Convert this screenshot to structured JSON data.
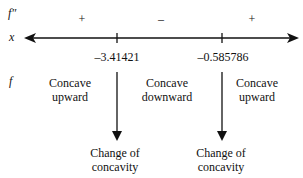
{
  "rows": {
    "second_derivative_label": "f″",
    "x_label": "x",
    "f_label": "f"
  },
  "signs": [
    "+",
    "–",
    "+"
  ],
  "critical_points": [
    "–3.41421",
    "–0.585786"
  ],
  "concavity": [
    {
      "line1": "Concave",
      "line2": "upward"
    },
    {
      "line1": "Concave",
      "line2": "downward"
    },
    {
      "line1": "Concave",
      "line2": "upward"
    }
  ],
  "inflection_labels": [
    {
      "line1": "Change of",
      "line2": "concavity"
    },
    {
      "line1": "Change of",
      "line2": "concavity"
    }
  ]
}
